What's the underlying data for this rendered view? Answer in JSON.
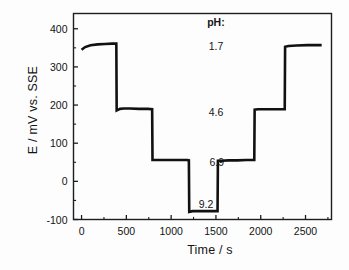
{
  "chart_data": {
    "type": "line",
    "title": "",
    "subtitle": "",
    "xlabel": "Time / s",
    "ylabel": "E / mV vs. SSE",
    "xlim": [
      -90,
      2790
    ],
    "ylim": [
      -100,
      440
    ],
    "xticks": [
      0,
      500,
      1000,
      1500,
      2000,
      2500
    ],
    "xtick_labels": [
      "0",
      "500",
      "1000",
      "1500",
      "2000",
      "2500"
    ],
    "yticks": [
      -100,
      0,
      100,
      200,
      300,
      400
    ],
    "ytick_labels": [
      "-100",
      "0",
      "100",
      "200",
      "300",
      "400"
    ],
    "minor_ticks": true,
    "grid": false,
    "legend": null,
    "series": [
      {
        "name": "Potential response",
        "color": "#111111",
        "x": [
          0,
          40,
          100,
          180,
          260,
          340,
          388,
          392,
          430,
          470,
          540,
          640,
          740,
          788,
          792,
          830,
          880,
          980,
          1080,
          1180,
          1198,
          1202,
          1240,
          1300,
          1380,
          1460,
          1518,
          1522,
          1560,
          1640,
          1740,
          1840,
          1928,
          1932,
          1970,
          2040,
          2140,
          2240,
          2268,
          2272,
          2310,
          2400,
          2520,
          2620,
          2680
        ],
        "y": [
          345,
          352,
          357,
          359,
          360,
          361,
          361,
          186,
          190,
          191,
          191,
          190,
          190,
          189,
          56,
          56,
          56,
          56,
          56,
          56,
          55,
          -80,
          -78,
          -78,
          -78,
          -78,
          -78,
          54,
          54,
          55,
          55,
          56,
          56,
          188,
          189,
          189,
          189,
          189,
          189,
          353,
          355,
          356,
          357,
          357,
          357
        ]
      }
    ],
    "plateaus": [
      {
        "ph": "1.7",
        "time_range": [
          0,
          390
        ],
        "potential": 358
      },
      {
        "ph": "4.6",
        "time_range": [
          392,
          790
        ],
        "potential": 189
      },
      {
        "ph": "6.9",
        "time_range": [
          792,
          1200
        ],
        "potential": 56
      },
      {
        "ph": "9.2",
        "time_range": [
          1202,
          1520
        ],
        "potential": -78
      },
      {
        "ph": "6.9",
        "time_range": [
          1522,
          1930
        ],
        "potential": 55
      },
      {
        "ph": "4.6",
        "time_range": [
          1932,
          2270
        ],
        "potential": 189
      },
      {
        "ph": "1.7",
        "time_range": [
          2272,
          2680
        ],
        "potential": 356
      }
    ],
    "annotations": {
      "header": "pH:",
      "header_position": {
        "x": 1500,
        "y": 418
      },
      "items": [
        {
          "label": "1.7",
          "x": 1500,
          "y": 355
        },
        {
          "label": "4.6",
          "x": 1500,
          "y": 182
        },
        {
          "label": "6.9",
          "x": 1510,
          "y": 52
        },
        {
          "label": "9.2",
          "x": 1390,
          "y": -60
        }
      ]
    }
  }
}
